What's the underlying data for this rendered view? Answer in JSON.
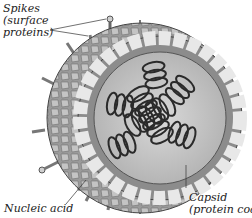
{
  "diagram": {
    "labels": {
      "spikes": {
        "line1": "Spikes",
        "line2": "(surface",
        "line3": "proteins)"
      },
      "nucleic_acid": {
        "line1": "Nucleic acid"
      },
      "capsid": {
        "line1": "Capsid",
        "line2": "(protein coat)"
      }
    },
    "colors": {
      "envelope": "#8a8a8a",
      "envelope_cells": "#b8b8b8",
      "capsid_cells": "#e6e6e6",
      "capsid_outline": "#555555",
      "interior": "#cfcfcf",
      "coil": "#2a2a2a",
      "spike": "#c8c8c8"
    }
  }
}
